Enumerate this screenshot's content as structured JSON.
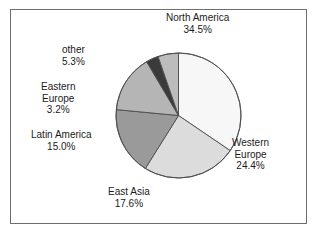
{
  "figure": {
    "background_color": "#ffffff",
    "frame_color": "#6e6e6e"
  },
  "chart_data": {
    "type": "pie",
    "title": "",
    "subtitle": "",
    "xlabel": "",
    "ylabel": "",
    "legend_position": "none",
    "grid": false,
    "start_angle_deg": 0,
    "direction": "clockwise",
    "units": "percent",
    "categories": [
      "North America",
      "Western Europe",
      "East Asia",
      "Latin America",
      "Eastern Europe",
      "other"
    ],
    "values": [
      34.5,
      24.4,
      17.6,
      15.0,
      3.2,
      5.3
    ],
    "value_labels": [
      "34.5%",
      "24.4%",
      "17.6%",
      "15.0%",
      "3.2%",
      "5.3%"
    ],
    "colors": [
      "#f7f7f7",
      "#dcdcdc",
      "#9a9a9a",
      "#b5b5b5",
      "#3a3a3a",
      "#bcbcbc"
    ],
    "slice_edge_color": "#4d4d4d",
    "slices": [
      {
        "name": "North America",
        "label_lines": [
          "North America",
          "34.5%"
        ],
        "value": 34.5,
        "value_label": "34.5%",
        "color": "#f7f7f7"
      },
      {
        "name": "Western Europe",
        "label_lines": [
          "Western",
          "Europe",
          "24.4%"
        ],
        "value": 24.4,
        "value_label": "24.4%",
        "color": "#dcdcdc"
      },
      {
        "name": "East Asia",
        "label_lines": [
          "East Asia",
          "17.6%"
        ],
        "value": 17.6,
        "value_label": "17.6%",
        "color": "#9a9a9a"
      },
      {
        "name": "Latin America",
        "label_lines": [
          "Latin America",
          "15.0%"
        ],
        "value": 15.0,
        "value_label": "15.0%",
        "color": "#b5b5b5"
      },
      {
        "name": "Eastern Europe",
        "label_lines": [
          "Eastern",
          "Europe",
          "3.2%"
        ],
        "value": 3.2,
        "value_label": "3.2%",
        "color": "#3a3a3a"
      },
      {
        "name": "other",
        "label_lines": [
          "other",
          "5.3%"
        ],
        "value": 5.3,
        "value_label": "5.3%",
        "color": "#bcbcbc"
      }
    ]
  },
  "labels": {
    "north_america": {
      "line1": "North America",
      "line2": "34.5%"
    },
    "western_europe": {
      "line1": "Western",
      "line2": "Europe",
      "line3": "24.4%"
    },
    "east_asia": {
      "line1": "East Asia",
      "line2": "17.6%"
    },
    "latin_america": {
      "line1": "Latin America",
      "line2": "15.0%"
    },
    "eastern_europe": {
      "line1": "Eastern",
      "line2": "Europe",
      "line3": "3.2%"
    },
    "other": {
      "line1": "other",
      "line2": "5.3%"
    }
  }
}
